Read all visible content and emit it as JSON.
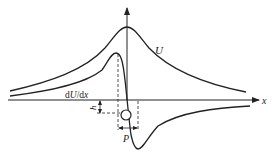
{
  "diagram": {
    "type": "potential-force-curve",
    "labels": {
      "potential": "U",
      "derivative_prefix": "d",
      "derivative_U": "U",
      "derivative_sep": "/d",
      "derivative_x": "x",
      "x_axis": "x",
      "height": "h",
      "offset": "P"
    },
    "colors": {
      "stroke": "#222222",
      "background": "#ffffff"
    }
  }
}
